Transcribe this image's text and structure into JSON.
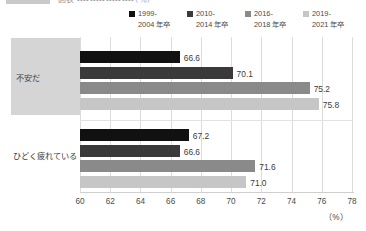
{
  "top_caption": {
    "tag": "",
    "text": "図表 ・・・・・・・・・・・・・・・・・・（％）"
  },
  "chart_data": {
    "type": "bar",
    "orientation": "horizontal",
    "title": "",
    "xlabel": "(%)",
    "ylabel": "",
    "xlim": [
      60,
      78
    ],
    "xticks": [
      60,
      62,
      64,
      66,
      68,
      70,
      72,
      74,
      76,
      78
    ],
    "grid": true,
    "legend_position": "top-right",
    "categories": [
      "不安だ",
      "ひどく疲れている"
    ],
    "series": [
      {
        "name": "1999-\n2004 年卒",
        "color": "#111111",
        "values": [
          66.6,
          67.2
        ]
      },
      {
        "name": "2010-\n2014 年卒",
        "color": "#3a3a3a",
        "values": [
          70.1,
          66.6
        ]
      },
      {
        "name": "2016-\n2018 年卒",
        "color": "#8a8a8a",
        "values": [
          75.2,
          71.6
        ]
      },
      {
        "name": "2019-\n2021 年卒",
        "color": "#c6c6c6",
        "values": [
          75.8,
          71.0
        ]
      }
    ],
    "value_labels": [
      [
        "66.6",
        "70.1",
        "75.2",
        "75.8"
      ],
      [
        "67.2",
        "66.6",
        "71.6",
        "71.0"
      ]
    ],
    "xtick_labels": [
      "60",
      "62",
      "64",
      "66",
      "68",
      "70",
      "72",
      "74",
      "76",
      "78"
    ],
    "unit_label": "（%）"
  },
  "colors": {
    "grid": "#dcdcdc",
    "axis": "#cfcfcf",
    "category_block": "#d5d5d5",
    "text": "#3c3c3c"
  }
}
